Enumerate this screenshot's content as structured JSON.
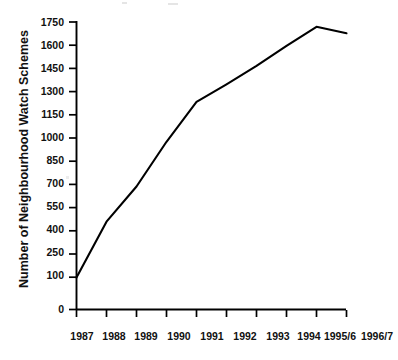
{
  "figure": {
    "kind": "scanned-line-chart",
    "background_color": "#ffffff",
    "ink_color": "#000000"
  },
  "chart_data": {
    "type": "line",
    "title": "",
    "subtitle": "",
    "xlabel": "",
    "ylabel": "Number of Neighbourhood Watch Schemes",
    "categories": [
      "1987",
      "1988",
      "1989",
      "1990",
      "1991",
      "1992",
      "1993",
      "1994",
      "1995/6",
      "1996/7"
    ],
    "values": [
      150,
      500,
      720,
      1000,
      1250,
      1360,
      1475,
      1600,
      1720,
      1680
    ],
    "series": [
      {
        "name": "Number of Neighbourhood Watch Schemes",
        "values": [
          150,
          500,
          720,
          1000,
          1250,
          1360,
          1475,
          1600,
          1720,
          1680
        ]
      }
    ],
    "ylim": [
      0,
      1750
    ],
    "ytick_labels": [
      "0",
      "100",
      "250",
      "400",
      "550",
      "700",
      "850",
      "1000",
      "1150",
      "1300",
      "1450",
      "1600",
      "1750"
    ],
    "ytick_values": [
      0,
      100,
      250,
      400,
      550,
      700,
      850,
      1000,
      1150,
      1300,
      1450,
      1600,
      1750
    ],
    "xtick_labels": [
      "1987",
      "1988",
      "1989",
      "1990",
      "1991",
      "1992",
      "1993",
      "1994",
      "1995/6",
      "1996/7"
    ],
    "grid": false,
    "legend": null,
    "legend_position": "none",
    "line_color": "#000000",
    "annotations": []
  }
}
